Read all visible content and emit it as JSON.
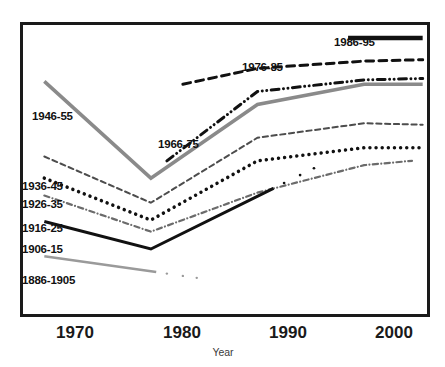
{
  "chart_data": {
    "type": "line",
    "title": "",
    "subtitle": "",
    "xlabel": "Year",
    "ylabel": "",
    "xlim": [
      1968,
      2006
    ],
    "ylim": [
      0,
      100
    ],
    "grid": false,
    "legend": "inline-labels",
    "xticks": [
      1970,
      1980,
      1990,
      2000
    ],
    "xtick_labels": [
      "1970",
      "1980",
      "1990",
      "2000"
    ],
    "ytick_labels": [],
    "annotations": [
      "1946-55",
      "1936-45",
      "1926-35",
      "1916-25",
      "1906-15",
      "1886-1905",
      "1966-75",
      "1976-85",
      "1986-95"
    ],
    "series": [
      {
        "name": "1986-95",
        "style": "solid",
        "color": "#111111",
        "width": 4.5,
        "note": "legend stub only, drawn at top right",
        "x": [
          1998.5,
          2005.5
        ],
        "values": [
          95.5,
          95.5
        ]
      },
      {
        "name": "1976-85",
        "style": "dashed",
        "color": "#111111",
        "width": 3,
        "x": [
          1983,
          1990,
          2000,
          2005.5
        ],
        "values": [
          79.5,
          85.0,
          87.5,
          88.0
        ]
      },
      {
        "name": "1966-75",
        "style": "dashdotdot",
        "color": "#111111",
        "width": 3,
        "x": [
          1981.5,
          1990,
          2000,
          2005.5
        ],
        "values": [
          53.0,
          77.0,
          81.0,
          81.5
        ]
      },
      {
        "name": "1946-55",
        "style": "solid",
        "color": "#8a8a8a",
        "width": 3.5,
        "x": [
          1970,
          1980,
          1990,
          2000,
          2005.5
        ],
        "values": [
          80.5,
          47.0,
          72.5,
          79.5,
          79.5
        ]
      },
      {
        "name": "1936-45",
        "style": "dashed",
        "color": "#4d4d4d",
        "width": 2,
        "x": [
          1970,
          1980,
          1990,
          2000,
          2005.5
        ],
        "values": [
          54.5,
          38.5,
          61.0,
          66.0,
          65.5
        ]
      },
      {
        "name": "1926-35",
        "style": "dotted",
        "color": "#111111",
        "width": 3.5,
        "x": [
          1970,
          1980,
          1990,
          2000,
          2005.5
        ],
        "values": [
          47.0,
          32.5,
          53.0,
          57.5,
          57.5
        ]
      },
      {
        "name": "1916-25",
        "style": "dashdot",
        "color": "#6b6b6b",
        "width": 2.2,
        "x": [
          1970,
          1980,
          1990,
          2000,
          2004.5
        ],
        "values": [
          41.0,
          28.5,
          42.0,
          51.5,
          53.0
        ]
      },
      {
        "name": "1906-15",
        "style": "solid",
        "color": "#111111",
        "width": 3,
        "x": [
          1970,
          1980,
          1991.5
        ],
        "values": [
          32.0,
          22.5,
          43.5
        ],
        "trailing_dots": [
          1992.5,
          1994.0,
          1995.3
        ]
      },
      {
        "name": "1886-1905",
        "style": "solid",
        "color": "#9a9a9a",
        "width": 2.5,
        "x": [
          1970,
          1980.5
        ],
        "values": [
          20.0,
          14.5
        ],
        "trailing_dots": [
          1981.5,
          1983.0,
          1984.3
        ]
      }
    ]
  },
  "labels": {
    "s1946_55": "1946-55",
    "s1936_45": "1936-45",
    "s1926_35": "1926-35",
    "s1916_25": "1916-25",
    "s1906_15": "1906-15",
    "s1886_1905": "1886-1905",
    "s1966_75": "1966-75",
    "s1976_85": "1976-85",
    "s1986_95": "1986-95"
  },
  "axis": {
    "title": "Year",
    "tick_1970": "1970",
    "tick_1980": "1980",
    "tick_1990": "1990",
    "tick_2000": "2000"
  },
  "colors": {
    "frame": "#1a1a1a",
    "ink_black": "#111111",
    "gray_primary": "#8a8a8a",
    "gray_secondary": "#6b6b6b",
    "gray_light": "#9a9a9a",
    "background": "#ffffff"
  }
}
